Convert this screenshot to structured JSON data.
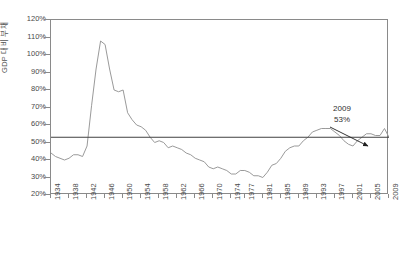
{
  "chart_data": {
    "type": "line",
    "title": "",
    "xlabel": "",
    "ylabel": "GDP 대비 부채",
    "ylim": [
      20,
      120
    ],
    "ytick_labels": [
      "120%",
      "110%",
      "100%",
      "90%",
      "80%",
      "70%",
      "60%",
      "50%",
      "40%",
      "30%",
      "20%"
    ],
    "ytick_values": [
      120,
      110,
      100,
      90,
      80,
      70,
      60,
      50,
      40,
      30,
      20
    ],
    "xlim": [
      1934,
      2009
    ],
    "xtick_labels": [
      "1934",
      "1938",
      "1942",
      "1946",
      "1950",
      "1954",
      "1958",
      "1962",
      "1966",
      "1970",
      "1974",
      "1977",
      "1981",
      "1985",
      "1989",
      "1993",
      "1997",
      "2001",
      "2005",
      "2009"
    ],
    "xtick_values": [
      1934,
      1938,
      1942,
      1946,
      1950,
      1954,
      1958,
      1962,
      1966,
      1970,
      1974,
      1977,
      1981,
      1985,
      1989,
      1993,
      1997,
      2001,
      2005,
      2009
    ],
    "grid": false,
    "legend": "none",
    "line_color": "#9a9a9a",
    "reference_line": {
      "value": 53,
      "label": "53%",
      "color": "#404040"
    },
    "annotation": {
      "year": "2009",
      "value": "53%",
      "arrow": true
    },
    "series": [
      {
        "name": "GDP 대비 부채",
        "x": [
          1934,
          1935,
          1936,
          1937,
          1938,
          1939,
          1940,
          1941,
          1942,
          1943,
          1944,
          1945,
          1946,
          1947,
          1948,
          1949,
          1950,
          1951,
          1952,
          1953,
          1954,
          1955,
          1956,
          1957,
          1958,
          1959,
          1960,
          1961,
          1962,
          1963,
          1964,
          1965,
          1966,
          1967,
          1968,
          1969,
          1970,
          1971,
          1972,
          1973,
          1974,
          1975,
          1976,
          1977,
          1978,
          1979,
          1980,
          1981,
          1982,
          1983,
          1984,
          1985,
          1986,
          1987,
          1988,
          1989,
          1990,
          1991,
          1992,
          1993,
          1994,
          1995,
          1996,
          1997,
          1998,
          1999,
          2000,
          2001,
          2002,
          2003,
          2004,
          2005,
          2006,
          2007,
          2008,
          2009
        ],
        "values": [
          44,
          42,
          41,
          40,
          41,
          43,
          43,
          42,
          48,
          71,
          92,
          108,
          106,
          92,
          80,
          79,
          80,
          67,
          63,
          60,
          59,
          57,
          53,
          50,
          51,
          50,
          47,
          48,
          47,
          46,
          44,
          43,
          41,
          40,
          39,
          36,
          35,
          36,
          35,
          34,
          32,
          32,
          34,
          34,
          33,
          31,
          31,
          30,
          33,
          37,
          38,
          41,
          45,
          47,
          48,
          48,
          51,
          53,
          56,
          57,
          58,
          58,
          58,
          56,
          54,
          51,
          49,
          48,
          51,
          53,
          55,
          55,
          54,
          54,
          58,
          53
        ]
      }
    ]
  },
  "axis": {
    "y_title": "GDP 대비 부채"
  },
  "annotation": {
    "year": "2009",
    "value": "53%"
  }
}
